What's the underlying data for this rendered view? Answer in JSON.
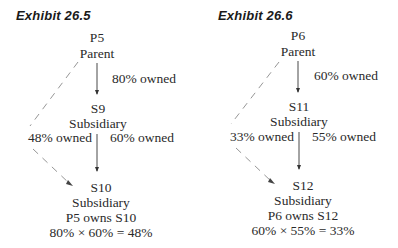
{
  "exhibits": [
    {
      "title": "Exhibit 26.5",
      "parent": {
        "code": "P5",
        "role": "Parent"
      },
      "middle": {
        "code": "S9",
        "role": "Subsidiary"
      },
      "bottom": {
        "code": "S10",
        "role": "Subsidiary",
        "note": "P5 owns S10",
        "formula": "80% × 60% = 48%"
      },
      "edges": {
        "parent_to_middle": "80% owned",
        "middle_to_bottom": "60% owned",
        "indirect": "48% owned"
      }
    },
    {
      "title": "Exhibit 26.6",
      "parent": {
        "code": "P6",
        "role": "Parent"
      },
      "middle": {
        "code": "S11",
        "role": "Subsidiary"
      },
      "bottom": {
        "code": "S12",
        "role": "Subsidiary",
        "note": "P6 owns S12",
        "formula": "60% × 55% = 33%"
      },
      "edges": {
        "parent_to_middle": "60% owned",
        "middle_to_bottom": "55% owned",
        "indirect": "33% owned"
      }
    }
  ],
  "colors": {
    "text": "#2a2a2a",
    "line": "#333333",
    "dashed": "#8a8a8a"
  }
}
